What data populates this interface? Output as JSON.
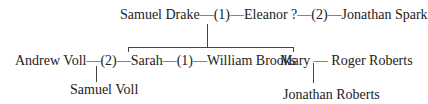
{
  "row1": {
    "person_a": "Samuel Drake",
    "marriage_1": "—(1)—",
    "person_b": "Eleanor ?",
    "marriage_2": "—(2)—",
    "person_c": "Jonathan Spark"
  },
  "row2": {
    "person_a": "Andrew Voll",
    "marriage_2": "—(2)—",
    "person_b": "Sarah",
    "marriage_1": "—(1)—",
    "person_c": "William Brooks",
    "person_d": "Mary",
    "marriage_d": " — ",
    "person_e": "Roger Roberts"
  },
  "row3": {
    "child_voll": "Samuel Voll",
    "child_roberts": "Jonathan Roberts"
  }
}
